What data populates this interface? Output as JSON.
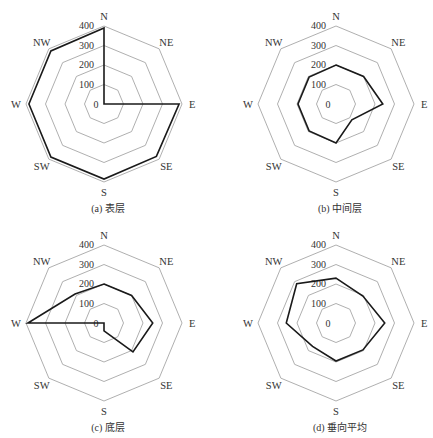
{
  "figure": {
    "directions": [
      "N",
      "NE",
      "E",
      "SE",
      "S",
      "SW",
      "W",
      "NW"
    ],
    "radial_ticks": [
      "0",
      "100",
      "200",
      "300",
      "400"
    ]
  },
  "panels": [
    {
      "caption": "(a) 表层"
    },
    {
      "caption": "(b) 中间层"
    },
    {
      "caption": "(c) 底层"
    },
    {
      "caption": "(d) 垂向平均"
    }
  ],
  "chart_data": [
    {
      "type": "radar",
      "title": "(a) 表层",
      "categories": [
        "N",
        "NE",
        "E",
        "SE",
        "S",
        "SW",
        "W",
        "NW"
      ],
      "values": [
        390,
        0,
        385,
        380,
        385,
        385,
        385,
        385
      ],
      "rlim": [
        0,
        400
      ],
      "rticks": [
        0,
        100,
        200,
        300,
        400
      ],
      "grid": true
    },
    {
      "type": "radar",
      "title": "(b) 中间层",
      "categories": [
        "N",
        "NE",
        "E",
        "SE",
        "S",
        "SW",
        "W",
        "NW"
      ],
      "values": [
        200,
        200,
        240,
        115,
        200,
        195,
        195,
        195
      ],
      "rlim": [
        0,
        400
      ],
      "rticks": [
        0,
        100,
        200,
        300,
        400
      ],
      "grid": true
    },
    {
      "type": "radar",
      "title": "(c) 底层",
      "categories": [
        "N",
        "NE",
        "E",
        "SE",
        "S",
        "SW",
        "W",
        "NW"
      ],
      "values": [
        200,
        200,
        250,
        210,
        40,
        0,
        390,
        210
      ],
      "rlim": [
        0,
        400
      ],
      "rticks": [
        0,
        100,
        200,
        300,
        400
      ],
      "grid": true
    },
    {
      "type": "radar",
      "title": "(d) 垂向平均",
      "categories": [
        "N",
        "NE",
        "E",
        "SE",
        "S",
        "SW",
        "W",
        "NW"
      ],
      "values": [
        230,
        195,
        250,
        195,
        195,
        170,
        255,
        285
      ],
      "rlim": [
        0,
        400
      ],
      "rticks": [
        0,
        100,
        200,
        300,
        400
      ],
      "grid": true
    }
  ]
}
